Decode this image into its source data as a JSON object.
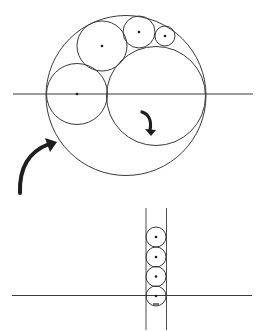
{
  "diagram": {
    "title": "",
    "colors": {
      "stroke": "#3a3a3a",
      "fill": "#1e1e1e",
      "background": "#ffffff"
    },
    "top_figure": {
      "axis_line": {
        "x1": 13,
        "y1": 94,
        "x2": 253,
        "y2": 94
      },
      "outer_circle": {
        "cx": 126,
        "cy": 95.5,
        "r": 80
      },
      "inner_large_circle": {
        "cx": 156,
        "cy": 96,
        "r": 49.5
      },
      "chain_circles": [
        {
          "cx": 77,
          "cy": 94,
          "r": 30.5
        },
        {
          "cx": 102,
          "cy": 46,
          "r": 25
        },
        {
          "cx": 139,
          "cy": 32,
          "r": 16
        },
        {
          "cx": 165,
          "cy": 36,
          "r": 10
        }
      ],
      "inner_arrow": {
        "from": [
          142,
          112
        ],
        "to": [
          151,
          136
        ]
      }
    },
    "transition_arrow": {
      "from": [
        20,
        193
      ],
      "to": [
        57,
        142
      ]
    },
    "bottom_figure": {
      "axis_line": {
        "x1": 12,
        "y1": 295.5,
        "x2": 252,
        "y2": 295.5
      },
      "parallel_lines": [
        {
          "x": 146,
          "y1": 208,
          "y2": 330
        },
        {
          "x": 166.5,
          "y1": 208,
          "y2": 330
        }
      ],
      "circles": [
        {
          "cx": 156,
          "cy": 237,
          "r": 10
        },
        {
          "cx": 156,
          "cy": 257,
          "r": 10
        },
        {
          "cx": 156,
          "cy": 276.5,
          "r": 10
        },
        {
          "cx": 156,
          "cy": 296,
          "r": 10
        }
      ]
    }
  }
}
